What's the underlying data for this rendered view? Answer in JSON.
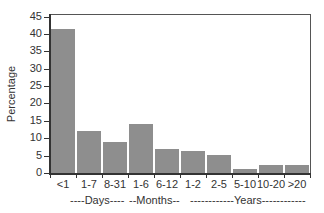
{
  "chart_data": {
    "type": "bar",
    "title": "",
    "xlabel": "",
    "ylabel": "Percentage",
    "ylim": [
      0,
      45
    ],
    "yticks": [
      0,
      5,
      10,
      15,
      20,
      25,
      30,
      35,
      40,
      45
    ],
    "categories": [
      "<1",
      "1-7",
      "8-31",
      "1-6",
      "6-12",
      "1-2",
      "2-5",
      "5-10",
      "10-20",
      ">20"
    ],
    "values": [
      41.5,
      12,
      9,
      14.2,
      7,
      6.2,
      5.3,
      1.1,
      2.4,
      2.3
    ],
    "groups": [
      {
        "label": "----Days----",
        "categories": [
          "<1",
          "1-7",
          "8-31"
        ]
      },
      {
        "label": "--Months--",
        "categories": [
          "1-6",
          "6-12"
        ]
      },
      {
        "label": "------------Years------------",
        "categories": [
          "1-2",
          "2-5",
          "5-10",
          "10-20",
          ">20"
        ]
      }
    ],
    "grid": false,
    "bar_color": "#8e8e8e"
  },
  "axis": {
    "ylabel": "Percentage",
    "yticks": [
      "0",
      "5",
      "10",
      "15",
      "20",
      "25",
      "30",
      "35",
      "40",
      "45"
    ]
  },
  "xlabels": [
    "<1",
    "1-7",
    "8-31",
    "1-6",
    "6-12",
    "1-2",
    "2-5",
    "5-10",
    "10-20",
    ">20"
  ],
  "groups": {
    "days": "----Days----",
    "months": "--Months--",
    "years": "------------Years------------"
  }
}
